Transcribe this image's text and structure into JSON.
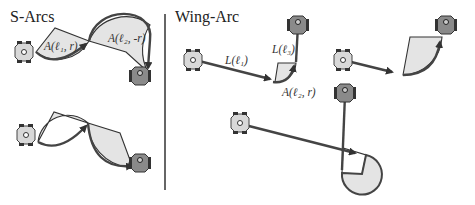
{
  "panels": {
    "left": {
      "title": "S-Arcs",
      "labels": [
        "A(ℓ₁, r)",
        "A(ℓ₂, -r)"
      ]
    },
    "right": {
      "title": "Wing-Arc",
      "labels": [
        "L(ℓ₁)",
        "L(ℓ₃)",
        "A(ℓ₂, r)"
      ]
    }
  },
  "colors": {
    "path": "#444444",
    "sector_fill": "#e4e4e4",
    "robot_light": "#d8d8d8",
    "robot_dark": "#8a8a8a",
    "divider": "#333333"
  }
}
